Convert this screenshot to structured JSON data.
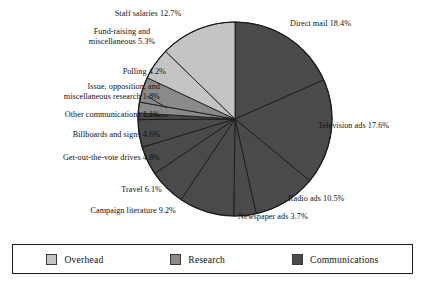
{
  "chart_data": {
    "type": "pie",
    "title": "",
    "legend_position": "bottom",
    "grid": false,
    "total_percent": 100.0,
    "units": "percent",
    "start_angle_deg": 0,
    "direction": "clockwise",
    "categories": [
      "Direct mail",
      "Television ads",
      "Radio ads",
      "Newspaper ads",
      "Campaign literature",
      "Travel",
      "Get-out-the-vote drives",
      "Billboards and signs",
      "Other communications",
      "Issue, opposition, and miscellaneous research",
      "Polling",
      "Fund-raising and miscellaneous",
      "Staff salaries"
    ],
    "values": [
      18.4,
      17.6,
      10.5,
      3.7,
      9.2,
      6.1,
      4.8,
      4.6,
      1.1,
      1.8,
      4.2,
      5.3,
      12.7
    ],
    "groups": [
      "Communications",
      "Communications",
      "Communications",
      "Communications",
      "Communications",
      "Communications",
      "Communications",
      "Communications",
      "Communications",
      "Research",
      "Research",
      "Overhead",
      "Overhead"
    ]
  },
  "slices": [
    {
      "id": "direct-mail",
      "label": "Direct mail 18.4%",
      "value": 18.4,
      "group": "Communications"
    },
    {
      "id": "television-ads",
      "label": "Television ads 17.6%",
      "value": 17.6,
      "group": "Communications"
    },
    {
      "id": "radio-ads",
      "label": "Radio ads 10.5%",
      "value": 10.5,
      "group": "Communications"
    },
    {
      "id": "newspaper-ads",
      "label": "Newspaper ads 3.7%",
      "value": 3.7,
      "group": "Communications"
    },
    {
      "id": "campaign-literature",
      "label": "Campaign literature 9.2%",
      "value": 9.2,
      "group": "Communications"
    },
    {
      "id": "travel",
      "label": "Travel 6.1%",
      "value": 6.1,
      "group": "Communications"
    },
    {
      "id": "get-out-the-vote",
      "label": "Get-out-the-vote drives 4.8%",
      "value": 4.8,
      "group": "Communications"
    },
    {
      "id": "billboards",
      "label": "Billboards and signs 4.6%",
      "value": 4.6,
      "group": "Communications"
    },
    {
      "id": "other-communications",
      "label": "Other communications 1.1%",
      "value": 1.1,
      "group": "Communications"
    },
    {
      "id": "issue-research",
      "label": "Issue, opposition, and miscellaneous research 1.8%",
      "line1": "Issue, opposition, and",
      "line2": "miscellaneous research 1.8%",
      "value": 1.8,
      "group": "Research"
    },
    {
      "id": "polling",
      "label": "Polling 4.2%",
      "value": 4.2,
      "group": "Research"
    },
    {
      "id": "fund-raising",
      "label": "Fund-raising and miscellaneous 5.3%",
      "line1": "Fund-raising and",
      "line2": "miscellaneous 5.3%",
      "value": 5.3,
      "group": "Overhead"
    },
    {
      "id": "staff-salaries",
      "label": "Staff salaries 12.7%",
      "value": 12.7,
      "group": "Overhead"
    }
  ],
  "legend": {
    "items": [
      {
        "id": "overhead",
        "label": "Overhead",
        "color": "#c4c4c4"
      },
      {
        "id": "research",
        "label": "Research",
        "color": "#8a8a8a"
      },
      {
        "id": "communications",
        "label": "Communications",
        "color": "#4a4a4a"
      }
    ]
  },
  "colors": {
    "overhead": "#c4c4c4",
    "research": "#8a8a8a",
    "communications": "#4a4a4a",
    "outline": "#1a1a1a",
    "background": "#ffffff",
    "text": "#111111"
  }
}
